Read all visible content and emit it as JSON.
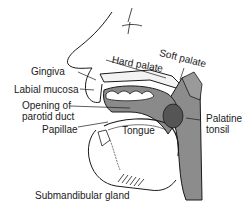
{
  "figure": {
    "title_fragment": "",
    "labels": {
      "hard_palate": "Hard palate",
      "soft_palate": "Soft palate",
      "gingiva": "Gingiva",
      "labial_mucosa": "Labial mucosa",
      "parotid_line1": "Opening of",
      "parotid_line2": "parotid duct",
      "papillae": "Papillae",
      "tongue": "Tongue",
      "palatine_line1": "Palatine",
      "palatine_line2": "tonsil",
      "submandibular": "Submandibular gland"
    },
    "colors": {
      "line": "#1a1a1a",
      "shade": "#8c8c8c",
      "dark_shade": "#555555",
      "background": "#ffffff"
    }
  }
}
